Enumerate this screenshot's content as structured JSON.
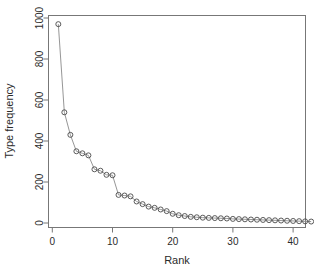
{
  "chart_data": {
    "type": "scatter",
    "title": "",
    "xlabel": "Rank",
    "ylabel": "Type frequency",
    "xlim": [
      0,
      44
    ],
    "ylim": [
      0,
      1030
    ],
    "xticks": [
      0,
      10,
      20,
      30,
      40
    ],
    "yticks": [
      0,
      200,
      400,
      600,
      800,
      1000
    ],
    "xtick_labels": [
      "0",
      "10",
      "20",
      "30",
      "40"
    ],
    "ytick_labels": [
      "0",
      "200",
      "400",
      "600",
      "800",
      "1000"
    ],
    "grid": false,
    "legend": "none",
    "marker": "open-circle",
    "line_style": "solid-thin",
    "point_color": "#4a4a4a",
    "line_color": "#8a8a8a",
    "frame_color": "#777777",
    "background": "#ffffff",
    "x": [
      1,
      2,
      3,
      4,
      5,
      6,
      7,
      8,
      9,
      10,
      11,
      12,
      13,
      14,
      15,
      16,
      17,
      18,
      19,
      20,
      21,
      22,
      23,
      24,
      25,
      26,
      27,
      28,
      29,
      30,
      31,
      32,
      33,
      34,
      35,
      36,
      37,
      38,
      39,
      40,
      41,
      42,
      43
    ],
    "values": [
      970,
      540,
      430,
      350,
      340,
      330,
      262,
      255,
      235,
      233,
      137,
      134,
      130,
      105,
      92,
      80,
      74,
      66,
      58,
      45,
      38,
      34,
      30,
      28,
      26,
      25,
      24,
      23,
      22,
      20,
      19,
      18,
      17,
      16,
      15,
      14,
      13,
      12,
      11,
      10,
      9,
      8,
      7
    ],
    "series": [
      {
        "name": "Type frequency by rank",
        "values": [
          970,
          540,
          430,
          350,
          340,
          330,
          262,
          255,
          235,
          233,
          137,
          134,
          130,
          105,
          92,
          80,
          74,
          66,
          58,
          45,
          38,
          34,
          30,
          28,
          26,
          25,
          24,
          23,
          22,
          20,
          19,
          18,
          17,
          16,
          15,
          14,
          13,
          12,
          11,
          10,
          9,
          8,
          7
        ]
      }
    ],
    "n_points": 43
  },
  "axes": {
    "x_title": "Rank",
    "y_title": "Type frequency"
  }
}
